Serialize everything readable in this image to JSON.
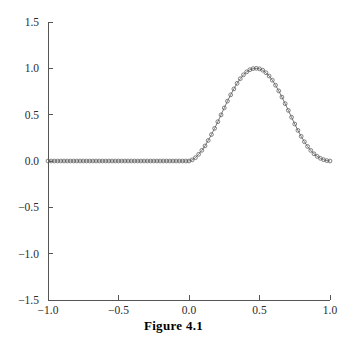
{
  "figure": {
    "caption": "Figure 4.1"
  },
  "chart_data": {
    "type": "line",
    "title": "",
    "subtitle": "",
    "xlabel": "",
    "ylabel": "",
    "xlim": [
      -1.0,
      1.0
    ],
    "ylim": [
      -1.5,
      1.5
    ],
    "grid": false,
    "legend": null,
    "legend_position": "none",
    "marker": "open-circle",
    "line_style": "solid",
    "line_color": "#6b6b6b",
    "marker_color": "#5a5a5a",
    "xticks": [
      -1.0,
      -0.5,
      0.0,
      0.5,
      1.0
    ],
    "xtick_labels": [
      "-1.0",
      "-0.5",
      "0.0",
      "0.5",
      "1.0"
    ],
    "yticks": [
      1.5,
      1.0,
      0.5,
      0.0,
      -0.5,
      -1.0,
      -1.5
    ],
    "ytick_labels": [
      "1.5",
      "1.0",
      "0.5",
      "0.0",
      "-0.5",
      "-1.0",
      "-1.5"
    ],
    "series": [
      {
        "name": "bump",
        "x": [
          -1.0,
          -0.9773,
          -0.9545,
          -0.9318,
          -0.9091,
          -0.8864,
          -0.8636,
          -0.8409,
          -0.8182,
          -0.7955,
          -0.7727,
          -0.75,
          -0.7273,
          -0.7045,
          -0.6818,
          -0.6591,
          -0.6364,
          -0.6136,
          -0.5909,
          -0.5682,
          -0.5455,
          -0.5227,
          -0.5,
          -0.4773,
          -0.4545,
          -0.4318,
          -0.4091,
          -0.3864,
          -0.3636,
          -0.3409,
          -0.3182,
          -0.2955,
          -0.2727,
          -0.25,
          -0.2273,
          -0.2045,
          -0.1818,
          -0.1591,
          -0.1364,
          -0.1136,
          -0.0909,
          -0.0682,
          -0.0455,
          -0.0227,
          0.0,
          0.0227,
          0.0455,
          0.0682,
          0.0909,
          0.1136,
          0.1364,
          0.1591,
          0.1818,
          0.2045,
          0.2273,
          0.25,
          0.2727,
          0.2955,
          0.3182,
          0.3409,
          0.3636,
          0.3864,
          0.4091,
          0.4318,
          0.4545,
          0.4773,
          0.5,
          0.5227,
          0.5455,
          0.5682,
          0.5909,
          0.6136,
          0.6364,
          0.6591,
          0.6818,
          0.7045,
          0.7273,
          0.75,
          0.7727,
          0.7955,
          0.8182,
          0.8409,
          0.8636,
          0.8864,
          0.9091,
          0.9318,
          0.9545,
          0.9773,
          1.0
        ],
        "y": [
          0.0,
          0.0,
          0.0,
          0.0,
          0.0,
          0.0,
          0.0,
          0.0,
          0.0,
          0.0,
          0.0,
          0.0,
          0.0,
          0.0,
          0.0,
          0.0,
          0.0,
          0.0,
          0.0,
          0.0,
          0.0,
          0.0,
          0.0,
          0.0,
          0.0,
          0.0,
          0.0,
          0.0,
          0.0,
          0.0,
          0.0,
          0.0,
          0.0,
          0.0,
          0.0,
          0.0,
          0.0,
          0.0,
          0.0,
          0.0,
          0.0,
          0.0,
          0.0,
          0.0,
          0.0,
          0.012,
          0.036,
          0.072,
          0.115,
          0.163,
          0.222,
          0.285,
          0.352,
          0.424,
          0.498,
          0.573,
          0.646,
          0.714,
          0.778,
          0.838,
          0.888,
          0.93,
          0.962,
          0.985,
          0.997,
          1.0,
          0.995,
          0.98,
          0.953,
          0.917,
          0.872,
          0.818,
          0.757,
          0.69,
          0.619,
          0.546,
          0.472,
          0.399,
          0.33,
          0.266,
          0.208,
          0.157,
          0.114,
          0.078,
          0.05,
          0.029,
          0.014,
          0.004,
          0.0
        ]
      }
    ]
  },
  "axes_geometry": {
    "plot_left_px": 48,
    "plot_right_px": 330,
    "plot_top_px": 22,
    "plot_bottom_px": 300
  }
}
